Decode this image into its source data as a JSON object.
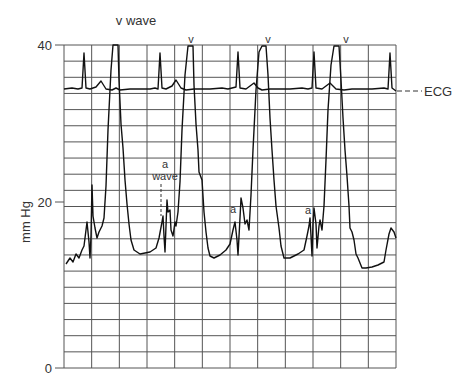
{
  "chart_data": {
    "type": "line",
    "title": "",
    "xlabel": "",
    "ylabel": "mm Hg",
    "ylim": [
      0,
      40
    ],
    "yticks": [
      0,
      20,
      40
    ],
    "grid": true,
    "grid_columns": 12,
    "grid_rows": 20,
    "series": [
      {
        "name": "ECG",
        "description": "Electrocardiogram trace along top of chart (uncalibrated, baseline ~34 mm Hg on grid)",
        "baseline_mmHg": 34.5,
        "r_wave_peaks_x_fraction": [
          0.07,
          0.33,
          0.52,
          0.75,
          0.98
        ],
        "t_wave_count": 5
      },
      {
        "name": "Pressure",
        "description": "Atrial/wedge pressure tracing with large v waves and smaller a waves",
        "unit": "mm Hg",
        "points": [
          {
            "x": 0.0,
            "y": 13.0
          },
          {
            "x": 0.03,
            "y": 14.5
          },
          {
            "x": 0.06,
            "y": 16.5
          },
          {
            "x": 0.08,
            "y": 15.0
          },
          {
            "x": 0.085,
            "y": 21.5
          },
          {
            "x": 0.09,
            "y": 17.0
          },
          {
            "x": 0.11,
            "y": 15.5
          },
          {
            "x": 0.14,
            "y": 22.0
          },
          {
            "x": 0.16,
            "y": 40.0
          },
          {
            "x": 0.17,
            "y": 40.0
          },
          {
            "x": 0.19,
            "y": 30.0
          },
          {
            "x": 0.21,
            "y": 18.0
          },
          {
            "x": 0.23,
            "y": 14.5
          },
          {
            "x": 0.26,
            "y": 14.0
          },
          {
            "x": 0.3,
            "y": 15.5
          },
          {
            "x": 0.3,
            "y": 17.5
          },
          {
            "x": 0.31,
            "y": 15.0
          },
          {
            "x": 0.32,
            "y": 19.5
          },
          {
            "x": 0.34,
            "y": 16.0
          },
          {
            "x": 0.36,
            "y": 18.0
          },
          {
            "x": 0.38,
            "y": 40.0
          },
          {
            "x": 0.39,
            "y": 40.0
          },
          {
            "x": 0.42,
            "y": 25.0
          },
          {
            "x": 0.45,
            "y": 15.5
          },
          {
            "x": 0.47,
            "y": 13.5
          },
          {
            "x": 0.51,
            "y": 15.0
          },
          {
            "x": 0.53,
            "y": 18.5
          },
          {
            "x": 0.54,
            "y": 14.0
          },
          {
            "x": 0.55,
            "y": 21.5
          },
          {
            "x": 0.57,
            "y": 16.5
          },
          {
            "x": 0.59,
            "y": 20.0
          },
          {
            "x": 0.61,
            "y": 40.0
          },
          {
            "x": 0.62,
            "y": 40.0
          },
          {
            "x": 0.65,
            "y": 22.0
          },
          {
            "x": 0.67,
            "y": 15.0
          },
          {
            "x": 0.69,
            "y": 13.5
          },
          {
            "x": 0.72,
            "y": 14.5
          },
          {
            "x": 0.74,
            "y": 17.5
          },
          {
            "x": 0.75,
            "y": 14.0
          },
          {
            "x": 0.76,
            "y": 21.0
          },
          {
            "x": 0.78,
            "y": 16.0
          },
          {
            "x": 0.8,
            "y": 19.0
          },
          {
            "x": 0.83,
            "y": 40.0
          },
          {
            "x": 0.85,
            "y": 40.0
          },
          {
            "x": 0.87,
            "y": 22.0
          },
          {
            "x": 0.89,
            "y": 14.0
          },
          {
            "x": 0.91,
            "y": 12.5
          },
          {
            "x": 0.95,
            "y": 13.0
          },
          {
            "x": 0.98,
            "y": 15.5
          },
          {
            "x": 1.0,
            "y": 16.0
          }
        ]
      }
    ],
    "annotations": [
      {
        "text": "v wave",
        "x_fraction": 0.18,
        "position": "above plot"
      },
      {
        "text": "v",
        "x_fraction": 0.385,
        "position": "above plot"
      },
      {
        "text": "v",
        "x_fraction": 0.615,
        "position": "above plot"
      },
      {
        "text": "v",
        "x_fraction": 0.84,
        "position": "above plot"
      },
      {
        "text": "a wave",
        "x_fraction": 0.3,
        "y": 23,
        "style": "dashed pointer"
      },
      {
        "text": "a",
        "x_fraction": 0.51,
        "y": 19
      },
      {
        "text": "a",
        "x_fraction": 0.72,
        "y": 18.5
      },
      {
        "text": "ECG",
        "position": "right of plot",
        "style": "dashed leader"
      }
    ],
    "legend": null
  },
  "labels": {
    "y_axis": "mm Hg",
    "tick_40": "40",
    "tick_20": "20",
    "tick_0": "0",
    "v_wave": "v wave",
    "v": "v",
    "a_wave_a": "a",
    "a_wave_wave": "wave",
    "a": "a",
    "ecg": "ECG"
  },
  "colors": {
    "trace": "#111111",
    "grid": "#555555",
    "text": "#333333",
    "background": "#ffffff"
  }
}
